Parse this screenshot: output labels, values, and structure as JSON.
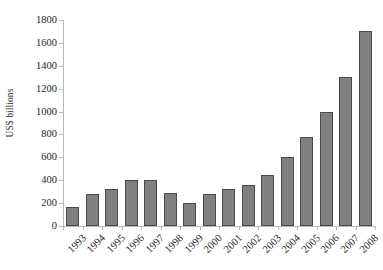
{
  "chart_data": {
    "type": "bar",
    "title": "",
    "subtitle": "",
    "xlabel": "",
    "ylabel": "US$ billions",
    "ylim": [
      0,
      1800
    ],
    "ytick_step": 200,
    "yticks": [
      0,
      200,
      400,
      600,
      800,
      1000,
      1200,
      1400,
      1600,
      1800
    ],
    "ytick_labels": [
      "0",
      "200",
      "400",
      "600",
      "800",
      "1000",
      "1200",
      "1400",
      "1600",
      "1800"
    ],
    "grid": false,
    "legend": null,
    "legend_position": "none",
    "bar_color": "#808080",
    "bar_border_color": "#4a4a4a",
    "axis_color": "#b9b9b9",
    "xtick_label_rotation": -45,
    "categories": [
      "1993",
      "1994",
      "1995",
      "1996",
      "1997",
      "1998",
      "1999",
      "2000",
      "2001",
      "2002",
      "2003",
      "2004",
      "2005",
      "2006",
      "2007",
      "2008"
    ],
    "values": [
      170,
      280,
      320,
      400,
      405,
      290,
      200,
      280,
      320,
      360,
      450,
      600,
      780,
      1000,
      1300,
      1700
    ],
    "series": [
      {
        "name": "US$ billions",
        "values": [
          170,
          280,
          320,
          400,
          405,
          290,
          200,
          280,
          320,
          360,
          450,
          600,
          780,
          1000,
          1300,
          1700
        ]
      }
    ],
    "annotations": []
  }
}
